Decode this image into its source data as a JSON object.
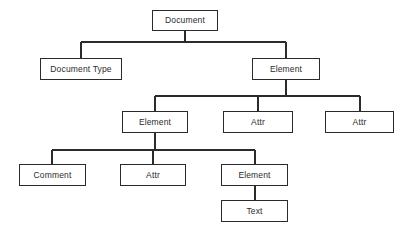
{
  "diagram": {
    "type": "tree",
    "colors": {
      "background": "#ffffff",
      "node_border": "#2b2b2b",
      "node_fill": "#ffffff",
      "edge": "#2b2b2b",
      "text": "#2b2b2b"
    },
    "nodes": [
      {
        "id": "document",
        "label": "Document",
        "level": 0,
        "x": 152,
        "y": 10,
        "w": 66,
        "h": 21
      },
      {
        "id": "document-type",
        "label": "Document Type",
        "level": 1,
        "x": 40,
        "y": 58,
        "w": 82,
        "h": 22
      },
      {
        "id": "element-1",
        "label": "Element",
        "level": 1,
        "x": 252,
        "y": 58,
        "w": 68,
        "h": 22
      },
      {
        "id": "element-2",
        "label": "Element",
        "level": 2,
        "x": 122,
        "y": 111,
        "w": 66,
        "h": 22
      },
      {
        "id": "attr-1",
        "label": "Attr",
        "level": 2,
        "x": 223,
        "y": 111,
        "w": 70,
        "h": 22
      },
      {
        "id": "attr-2",
        "label": "Attr",
        "level": 2,
        "x": 325,
        "y": 111,
        "w": 69,
        "h": 22
      },
      {
        "id": "comment-1",
        "label": "Comment",
        "level": 3,
        "x": 19,
        "y": 164,
        "w": 67,
        "h": 22
      },
      {
        "id": "attr-3",
        "label": "Attr",
        "level": 3,
        "x": 120,
        "y": 164,
        "w": 66,
        "h": 22
      },
      {
        "id": "element-3",
        "label": "Element",
        "level": 3,
        "x": 221,
        "y": 164,
        "w": 67,
        "h": 22
      },
      {
        "id": "text-1",
        "label": "Text",
        "level": 4,
        "x": 221,
        "y": 200,
        "w": 67,
        "h": 22
      }
    ],
    "edges": [
      {
        "id": "edge-document-to-children",
        "from": "document",
        "to": [
          "document-type",
          "element-1"
        ],
        "stem_x": 185,
        "stem_from_y": 31,
        "bus_y": 42,
        "bus_x1": 81,
        "bus_x2": 286,
        "drops": [
          {
            "x": 81,
            "to_y": 58
          },
          {
            "x": 286,
            "to_y": 58
          }
        ]
      },
      {
        "id": "edge-element1-to-children",
        "from": "element-1",
        "to": [
          "element-2",
          "attr-1",
          "attr-2"
        ],
        "stem_x": 286,
        "stem_from_y": 80,
        "bus_y": 96,
        "bus_x1": 155,
        "bus_x2": 360,
        "drops": [
          {
            "x": 155,
            "to_y": 111
          },
          {
            "x": 258,
            "to_y": 111
          },
          {
            "x": 360,
            "to_y": 111
          }
        ]
      },
      {
        "id": "edge-element2-to-children",
        "from": "element-2",
        "to": [
          "comment-1",
          "attr-3",
          "element-3"
        ],
        "stem_x": 155,
        "stem_from_y": 133,
        "bus_y": 150,
        "bus_x1": 52,
        "bus_x2": 255,
        "drops": [
          {
            "x": 52,
            "to_y": 164
          },
          {
            "x": 153,
            "to_y": 164
          },
          {
            "x": 255,
            "to_y": 164
          }
        ]
      },
      {
        "id": "edge-element3-to-text",
        "from": "element-3",
        "to": [
          "text-1"
        ],
        "stem_x": 255,
        "stem_from_y": 186,
        "bus_y": 200,
        "bus_x1": 255,
        "bus_x2": 255,
        "drops": []
      }
    ]
  }
}
